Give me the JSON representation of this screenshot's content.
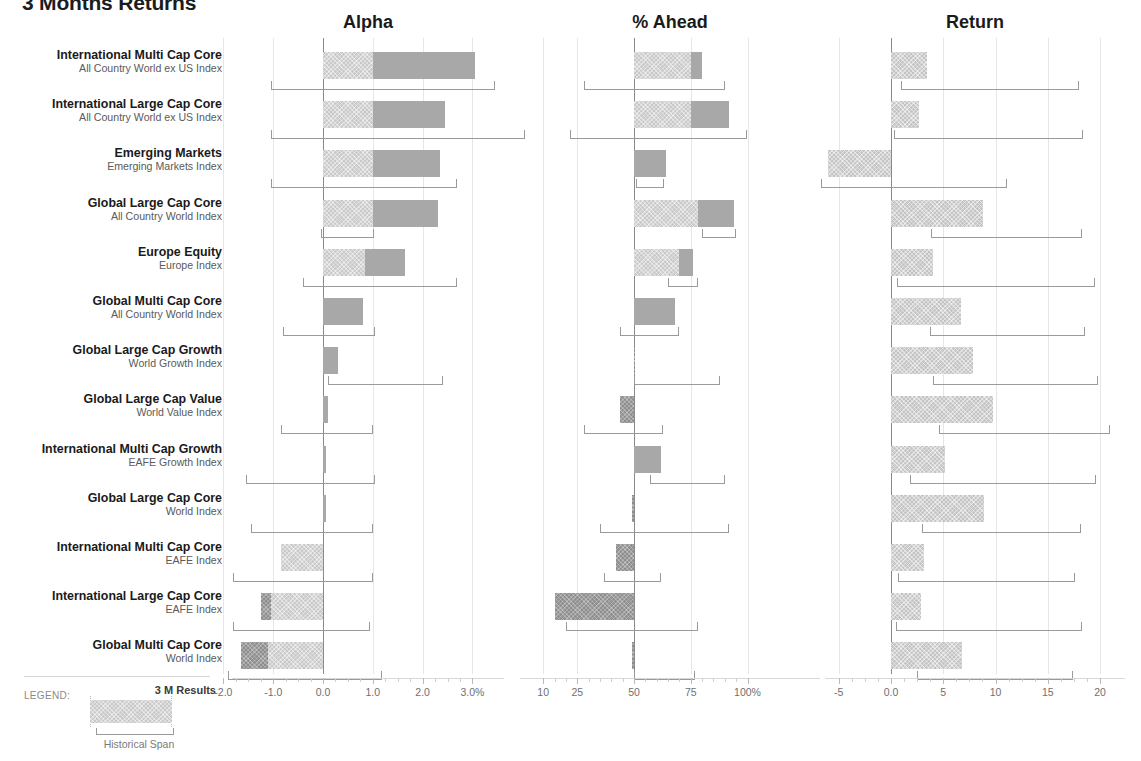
{
  "title": "3 Months Returns",
  "panels": [
    {
      "key": "alpha",
      "label": "Alpha",
      "left": 232,
      "width": 272,
      "zero_px": 91,
      "unit_px": 49.8,
      "ticks": [
        -2.0,
        -1.0,
        0.0,
        1.0,
        2.0,
        3.0
      ],
      "tick_labels": [
        "-2.0",
        "-1.0",
        "0.0",
        "1.0",
        "2.0",
        "3.0%"
      ]
    },
    {
      "key": "ahead",
      "label": "% Ahead",
      "left": 520,
      "width": 300,
      "zero_px": 114,
      "unit_px": 2.27,
      "ticks": [
        10,
        25,
        50,
        75,
        100
      ],
      "tick_labels": [
        "10",
        "25",
        "50",
        "75",
        "100%"
      ]
    },
    {
      "key": "return",
      "label": "Return",
      "left": 825,
      "width": 300,
      "zero_px": 66,
      "unit_px": 10.45,
      "ticks": [
        -5,
        0,
        5,
        10,
        15,
        20
      ],
      "tick_labels": [
        "-5",
        "0.0",
        "5",
        "10",
        "15",
        "20"
      ]
    }
  ],
  "legend": {
    "word": "LEGEND:",
    "result_label": "3 M Results",
    "span_label": "Historical Span"
  },
  "colors": {
    "bar_light": "#c9c9c9",
    "bar_mid": "#a8a8a8",
    "bar_dark": "#8e8e8e",
    "return_bar": "#c4c4c4",
    "zero_line": "#8a8a8a",
    "gridline": "#e6e6e6",
    "span_bracket": "#9a9a9a",
    "label_primary": "#1a1a1a",
    "label_secondary": "#5a5a5a",
    "axis_text": "#6f6f6f"
  },
  "chart_data": {
    "type": "bar",
    "title": "3 Months Returns",
    "orientation": "horizontal",
    "panel_count": 3,
    "legend": {
      "position": "bottom-left",
      "entries": [
        "3 M Results",
        "Historical Span"
      ]
    },
    "grid": true,
    "categories": [
      "International Multi Cap Core",
      "International Large Cap Core",
      "Emerging Markets",
      "Global Large Cap Core",
      "Europe Equity",
      "Global Multi Cap Core",
      "Global Large Cap Growth",
      "Global Large Cap Value",
      "International Multi Cap Growth",
      "Global Large Cap Core",
      "International Multi Cap Core",
      "International Large Cap Core",
      "Global Multi Cap Core"
    ],
    "benchmarks": [
      "All Country World ex US Index",
      "All Country World ex US Index",
      "Emerging Markets Index",
      "All Country World Index",
      "Europe Index",
      "All Country World Index",
      "World Growth Index",
      "World Value Index",
      "EAFE Growth Index",
      "World Index",
      "EAFE Index",
      "EAFE Index",
      "World Index"
    ],
    "panels": [
      {
        "name": "Alpha",
        "xlabel": "Alpha",
        "unit": "%",
        "xlim": [
          -2.3,
          3.3
        ],
        "ticks": [
          -2.0,
          -1.0,
          0.0,
          1.0,
          2.0,
          3.0
        ],
        "tick_labels": [
          "-2.0",
          "-1.0",
          "0.0",
          "1.0",
          "2.0",
          "3.0%"
        ],
        "bars": [
          {
            "start": 0.0,
            "split": 1.0,
            "end": 3.05
          },
          {
            "start": 0.0,
            "split": 1.0,
            "end": 2.45
          },
          {
            "start": 0.0,
            "split": 1.0,
            "end": 2.35
          },
          {
            "start": 0.0,
            "split": 1.0,
            "end": 2.3
          },
          {
            "start": 0.0,
            "split": 0.85,
            "end": 1.65
          },
          {
            "start": 0.0,
            "split": 0.0,
            "end": 0.8
          },
          {
            "start": 0.0,
            "split": 0.0,
            "end": 0.3
          },
          {
            "start": 0.0,
            "split": 0.0,
            "end": 0.1
          },
          {
            "start": 0.0,
            "split": 0.0,
            "end": 0.07
          },
          {
            "start": 0.0,
            "split": 0.0,
            "end": 0.07
          },
          {
            "start": -0.85,
            "split": -0.85,
            "end": 0.0
          },
          {
            "start": -1.25,
            "split": -1.05,
            "end": 0.0
          },
          {
            "start": -1.65,
            "split": -1.1,
            "end": 0.0
          }
        ],
        "spans": [
          {
            "low": -1.05,
            "high": 3.45
          },
          {
            "low": -1.05,
            "high": 4.05
          },
          {
            "low": -1.05,
            "high": 2.7
          },
          {
            "low": -0.05,
            "high": 1.02
          },
          {
            "low": -0.4,
            "high": 2.7
          },
          {
            "low": -0.8,
            "high": 1.05
          },
          {
            "low": 0.1,
            "high": 2.4
          },
          {
            "low": -0.85,
            "high": 1.0
          },
          {
            "low": -1.55,
            "high": 1.05
          },
          {
            "low": -1.45,
            "high": 1.0
          },
          {
            "low": -1.8,
            "high": 1.0
          },
          {
            "low": -1.8,
            "high": 0.95
          },
          {
            "low": -2.15,
            "high": 0.95
          }
        ]
      },
      {
        "name": "% Ahead",
        "xlabel": "% Ahead",
        "unit": "%",
        "xlim": [
          3,
          105
        ],
        "ticks": [
          10,
          25,
          50,
          75,
          100
        ],
        "tick_labels": [
          "10",
          "25",
          "50",
          "75",
          "100%"
        ],
        "bars": [
          {
            "start": 50,
            "split": 75,
            "end": 80
          },
          {
            "start": 50,
            "split": 75,
            "end": 92
          },
          {
            "start": 50,
            "split": 50,
            "end": 64
          },
          {
            "start": 50,
            "split": 78,
            "end": 94
          },
          {
            "start": 50,
            "split": 70,
            "end": 76
          },
          {
            "start": 50,
            "split": 50,
            "end": 68
          },
          {
            "start": 50,
            "split": 50,
            "end": 50
          },
          {
            "start": 44,
            "split": 44,
            "end": 50
          },
          {
            "start": 50,
            "split": 50,
            "end": 62
          },
          {
            "start": 49,
            "split": 49,
            "end": 50
          },
          {
            "start": 42,
            "split": 42,
            "end": 50
          },
          {
            "start": 15,
            "split": 15,
            "end": 50
          },
          {
            "start": 49,
            "split": 49,
            "end": 50
          }
        ],
        "spans": [
          {
            "low": 28,
            "high": 90
          },
          {
            "low": 22,
            "high": 100
          },
          {
            "low": 51,
            "high": 63
          },
          {
            "low": 80,
            "high": 95
          },
          {
            "low": 65,
            "high": 78
          },
          {
            "low": 44,
            "high": 70
          },
          {
            "low": 50,
            "high": 88
          },
          {
            "low": 28,
            "high": 63
          },
          {
            "low": 57,
            "high": 90
          },
          {
            "low": 35,
            "high": 92
          },
          {
            "low": 37,
            "high": 62
          },
          {
            "low": 20,
            "high": 78
          },
          {
            "low": 50,
            "high": 77
          }
        ]
      },
      {
        "name": "Return",
        "xlabel": "Return",
        "unit": "%",
        "xlim": [
          -7,
          21
        ],
        "ticks": [
          -5,
          0,
          5,
          10,
          15,
          20
        ],
        "tick_labels": [
          "-5",
          "0.0",
          "5",
          "10",
          "15",
          "20"
        ],
        "bars": [
          {
            "start": 0,
            "end": 3.4
          },
          {
            "start": 0,
            "end": 2.7
          },
          {
            "start": -6.0,
            "end": 0
          },
          {
            "start": 0,
            "end": 8.8
          },
          {
            "start": 0,
            "end": 4.0
          },
          {
            "start": 0,
            "end": 6.7
          },
          {
            "start": 0,
            "end": 7.8
          },
          {
            "start": 0,
            "end": 9.8
          },
          {
            "start": 0,
            "end": 5.2
          },
          {
            "start": 0,
            "end": 8.9
          },
          {
            "start": 0,
            "end": 3.2
          },
          {
            "start": 0,
            "end": 2.9
          },
          {
            "start": 0,
            "end": 6.8
          }
        ],
        "spans": [
          {
            "low": 1.0,
            "high": 18.0
          },
          {
            "low": 0.3,
            "high": 18.4
          },
          {
            "low": -7.0,
            "high": 10.8
          },
          {
            "low": 3.8,
            "high": 18.3
          },
          {
            "low": 0.6,
            "high": 19.5
          },
          {
            "low": 3.7,
            "high": 18.6
          },
          {
            "low": 4.0,
            "high": 19.8
          },
          {
            "low": 4.6,
            "high": 21.0
          },
          {
            "low": 1.8,
            "high": 19.6
          },
          {
            "low": 3.0,
            "high": 18.2
          },
          {
            "low": 0.7,
            "high": 17.6
          },
          {
            "low": 0.5,
            "high": 18.3
          },
          {
            "low": 2.5,
            "high": 17.4
          }
        ]
      }
    ]
  }
}
